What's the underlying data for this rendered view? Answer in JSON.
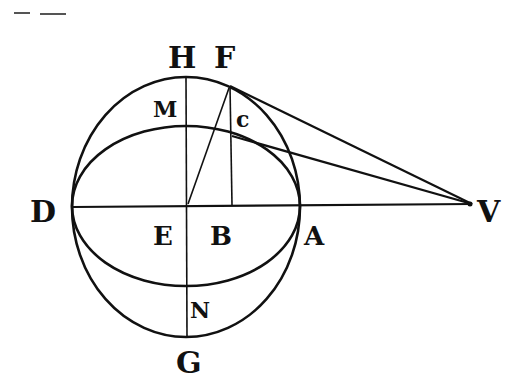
{
  "diagram": {
    "type": "geometric-figure",
    "colors": {
      "ink": "#111111",
      "paper": "#ffffff"
    },
    "labels": {
      "H": "H",
      "F": "F",
      "M": "M",
      "c": "c",
      "D": "D",
      "E": "E",
      "B": "B",
      "A": "A",
      "V": "V",
      "N": "N",
      "G": "G"
    },
    "points": {
      "D": [
        73,
        207
      ],
      "E": [
        186,
        206
      ],
      "B": [
        232,
        205
      ],
      "A": [
        300,
        205
      ],
      "V": [
        472,
        204
      ],
      "H": [
        186,
        77
      ],
      "G": [
        186,
        336
      ],
      "M": [
        186,
        126
      ],
      "N": [
        186,
        285
      ],
      "F": [
        230,
        86
      ],
      "c": [
        232,
        136
      ]
    },
    "segments": [
      [
        "D",
        "V"
      ],
      [
        "H",
        "G"
      ],
      [
        "F",
        "B"
      ],
      [
        "E",
        "F"
      ],
      [
        "F",
        "V"
      ],
      [
        "c",
        "V"
      ]
    ],
    "curves": [
      {
        "name": "outer-ellipse",
        "center": [
          186,
          207
        ],
        "rx": 114,
        "ry": 130
      },
      {
        "name": "inner-ellipse",
        "center": [
          186,
          206
        ],
        "rx": 114,
        "ry": 80
      }
    ]
  }
}
